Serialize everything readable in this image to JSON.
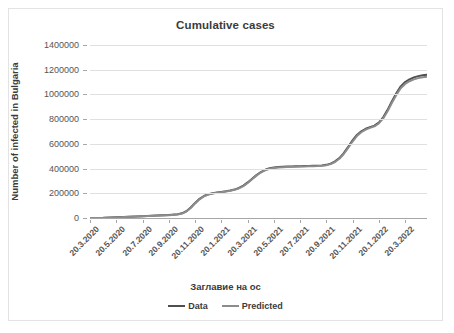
{
  "chart_data": {
    "type": "line",
    "title": "Cumulative cases",
    "xlabel": "Заглавие на ос",
    "ylabel": "Number of infected in Bulgaria",
    "ylim": [
      0,
      1400000
    ],
    "y_ticks": [
      0,
      200000,
      400000,
      600000,
      800000,
      1000000,
      1200000,
      1400000
    ],
    "y_tick_labels": [
      "0",
      "200000",
      "400000",
      "600000",
      "800000",
      "1000000",
      "1200000",
      "1400000"
    ],
    "grid": true,
    "legend_position": "bottom",
    "x_tick_labels": [
      "20.3.2020",
      "20.5.2020",
      "20.7.2020",
      "20.9.2020",
      "20.11.2020",
      "20.1.2021",
      "20.3.2021",
      "20.5.2021",
      "20.7.2021",
      "20.9.2021",
      "20.11.2021",
      "20.1.2022",
      "20.3.2022"
    ],
    "x_tick_positions": [
      0,
      0.0779,
      0.1558,
      0.2338,
      0.3117,
      0.3896,
      0.4675,
      0.5455,
      0.6234,
      0.7013,
      0.7792,
      0.8571,
      0.9351
    ],
    "colors": {
      "data": "#4f4f4f",
      "predicted": "#8c8c8c",
      "gridline": "#e0e0e0",
      "axis": "#a6a6a6"
    },
    "series": [
      {
        "name": "Data",
        "color": "#4f4f4f",
        "x": [
          0.0,
          0.039,
          0.078,
          0.117,
          0.156,
          0.195,
          0.234,
          0.26,
          0.273,
          0.286,
          0.299,
          0.312,
          0.325,
          0.338,
          0.351,
          0.364,
          0.377,
          0.39,
          0.403,
          0.416,
          0.429,
          0.442,
          0.455,
          0.468,
          0.481,
          0.494,
          0.507,
          0.52,
          0.533,
          0.546,
          0.559,
          0.572,
          0.585,
          0.598,
          0.61,
          0.623,
          0.636,
          0.649,
          0.662,
          0.675,
          0.688,
          0.701,
          0.714,
          0.727,
          0.74,
          0.753,
          0.766,
          0.779,
          0.792,
          0.805,
          0.818,
          0.831,
          0.844,
          0.857,
          0.87,
          0.883,
          0.896,
          0.909,
          0.922,
          0.935,
          0.948,
          0.961,
          0.974,
          0.987,
          1.0
        ],
        "y": [
          200,
          1500,
          5800,
          11000,
          15000,
          19500,
          24500,
          30000,
          38000,
          55000,
          85000,
          122000,
          155000,
          178000,
          192000,
          200000,
          206000,
          211000,
          216000,
          222000,
          230000,
          243000,
          262000,
          288000,
          318000,
          348000,
          372000,
          390000,
          402000,
          408000,
          412000,
          414000,
          416000,
          417000,
          418000,
          419000,
          420000,
          421000,
          422000,
          423000,
          425000,
          430000,
          440000,
          458000,
          485000,
          525000,
          575000,
          628000,
          672000,
          702000,
          722000,
          735000,
          748000,
          772000,
          815000,
          875000,
          945000,
          1010000,
          1065000,
          1100000,
          1122000,
          1138000,
          1148000,
          1155000,
          1160000
        ]
      },
      {
        "name": "Predicted",
        "color": "#8c8c8c",
        "x": [
          0.0,
          0.039,
          0.078,
          0.117,
          0.156,
          0.195,
          0.234,
          0.26,
          0.273,
          0.286,
          0.299,
          0.312,
          0.325,
          0.338,
          0.351,
          0.364,
          0.377,
          0.39,
          0.403,
          0.416,
          0.429,
          0.442,
          0.455,
          0.468,
          0.481,
          0.494,
          0.507,
          0.52,
          0.533,
          0.546,
          0.559,
          0.572,
          0.585,
          0.598,
          0.61,
          0.623,
          0.636,
          0.649,
          0.662,
          0.675,
          0.688,
          0.701,
          0.714,
          0.727,
          0.74,
          0.753,
          0.766,
          0.779,
          0.792,
          0.805,
          0.818,
          0.831,
          0.844,
          0.857,
          0.87,
          0.883,
          0.896,
          0.909,
          0.922,
          0.935,
          0.948,
          0.961,
          0.974,
          0.987,
          1.0
        ],
        "y": [
          0,
          900,
          4800,
          9600,
          13500,
          18000,
          23000,
          28500,
          36000,
          52000,
          81000,
          118000,
          151000,
          175000,
          190000,
          198000,
          204000,
          209000,
          214000,
          220000,
          228000,
          240000,
          258000,
          283000,
          313000,
          343000,
          368000,
          387000,
          399000,
          405000,
          409000,
          411000,
          413000,
          414000,
          415000,
          416000,
          417000,
          418000,
          419000,
          420000,
          422000,
          427000,
          436000,
          453000,
          479000,
          518000,
          567000,
          619000,
          663000,
          694000,
          715000,
          729000,
          742000,
          765000,
          806000,
          864000,
          932000,
          996000,
          1050000,
          1085000,
          1107000,
          1122000,
          1132000,
          1139000,
          1143000
        ]
      }
    ]
  },
  "legend": {
    "entries": [
      {
        "label": "Data",
        "color": "#4f4f4f"
      },
      {
        "label": "Predicted",
        "color": "#8c8c8c"
      }
    ]
  }
}
